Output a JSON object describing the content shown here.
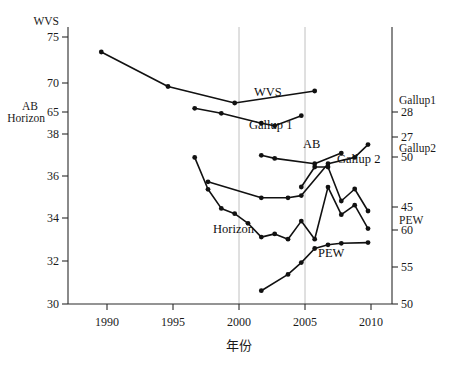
{
  "chart_data": {
    "type": "line",
    "title": "",
    "subtitle": "",
    "xlabel": "年份",
    "ylabel": "",
    "grid": "vertical gridlines at 2000 and 2005",
    "legend": "inline series labels placed next to each line",
    "xlim": [
      1987.5,
      2011.8
    ],
    "x_ticks": [
      1990,
      1995,
      2000,
      2005,
      2010
    ],
    "left_axis": {
      "name_top": "WVS",
      "name_bottom_line1": "AB",
      "name_bottom_line2": "Horizon",
      "wvs_ticks": [
        75,
        70,
        65
      ],
      "ab_horizon_ticks": [
        38,
        36,
        34,
        32,
        30
      ]
    },
    "right_axis": {
      "gallup1_name": "Gallup1",
      "gallup1_ticks": [
        28,
        27
      ],
      "gallup2_name": "Gallup2",
      "gallup2_ticks": [
        50,
        45
      ],
      "pew_name": "PEW",
      "pew_ticks": [
        60,
        55,
        50
      ]
    },
    "series": [
      {
        "name": "WVS",
        "label": "WVS",
        "axis": "WVS (left, 65-75)",
        "points": [
          {
            "x": 1990,
            "y": 73.0
          },
          {
            "x": 1995,
            "y": 68.4
          },
          {
            "x": 2000,
            "y": 66.2
          },
          {
            "x": 2006,
            "y": 67.8
          }
        ]
      },
      {
        "name": "Gallup 1",
        "label": "Gallup 1",
        "axis": "Gallup1 (right, 27-28)",
        "points": [
          {
            "x": 1997,
            "y": 28.15
          },
          {
            "x": 1999,
            "y": 27.95
          },
          {
            "x": 2002,
            "y": 27.55
          },
          {
            "x": 2003,
            "y": 27.45
          },
          {
            "x": 2005,
            "y": 27.85
          }
        ]
      },
      {
        "name": "AB",
        "label": "AB",
        "axis": "AB (left, 30-38)",
        "points": [
          {
            "x": 2002,
            "y": 37.0
          },
          {
            "x": 2003,
            "y": 36.85
          },
          {
            "x": 2006,
            "y": 36.6
          },
          {
            "x": 2008,
            "y": 37.1
          }
        ]
      },
      {
        "name": "Gallup 2",
        "label": "Gallup 2",
        "axis": "Gallup2 (right, 45-50)",
        "points": [
          {
            "x": 2005,
            "y": 47.0
          },
          {
            "x": 2006,
            "y": 49.0
          },
          {
            "x": 2007,
            "y": 49.0
          },
          {
            "x": 2008,
            "y": 45.6
          },
          {
            "x": 2009,
            "y": 46.8
          },
          {
            "x": 2010,
            "y": 44.6
          }
        ]
      },
      {
        "name": "Horizon top",
        "label": "",
        "axis": "Horizon (left, 30-38)",
        "points": [
          {
            "x": 1997,
            "y": 36.9
          },
          {
            "x": 1998,
            "y": 35.4
          },
          {
            "x": 1999,
            "y": 34.5
          },
          {
            "x": 2000,
            "y": 34.25
          },
          {
            "x": 2001,
            "y": 33.8
          },
          {
            "x": 2002,
            "y": 33.15
          },
          {
            "x": 2003,
            "y": 33.3
          },
          {
            "x": 2004,
            "y": 33.05
          },
          {
            "x": 2005,
            "y": 33.9
          },
          {
            "x": 2006,
            "y": 33.05
          },
          {
            "x": 2007,
            "y": 35.5
          },
          {
            "x": 2008,
            "y": 34.2
          },
          {
            "x": 2009,
            "y": 34.65
          },
          {
            "x": 2010,
            "y": 33.55
          }
        ]
      },
      {
        "name": "Horizon",
        "label": "Horizon",
        "axis": "Horizon (left, 30-38)",
        "points": [
          {
            "x": 1998,
            "y": 35.75
          },
          {
            "x": 2002,
            "y": 35.0
          },
          {
            "x": 2004,
            "y": 35.0
          },
          {
            "x": 2005,
            "y": 35.1
          },
          {
            "x": 2007,
            "y": 36.6
          },
          {
            "x": 2009,
            "y": 36.9
          },
          {
            "x": 2010,
            "y": 37.5
          }
        ]
      },
      {
        "name": "PEW",
        "label": "PEW",
        "axis": "PEW (right, 50-60)",
        "points": [
          {
            "x": 2002,
            "y": 51.8
          },
          {
            "x": 2004,
            "y": 54.0
          },
          {
            "x": 2005,
            "y": 55.6
          },
          {
            "x": 2006,
            "y": 57.5
          },
          {
            "x": 2007,
            "y": 58.0
          },
          {
            "x": 2008,
            "y": 58.2
          },
          {
            "x": 2010,
            "y": 58.3
          }
        ]
      }
    ]
  },
  "axes": {
    "x_tick_labels": [
      "1990",
      "1995",
      "2000",
      "2005",
      "2010"
    ],
    "x_title": "年份",
    "left_top_name": "WVS",
    "left_ticks": [
      "75",
      "70",
      "65",
      "38",
      "36",
      "34",
      "32",
      "30"
    ],
    "left_mid_name_1": "AB",
    "left_mid_name_2": "Horizon",
    "right_ticks": [
      "28",
      "27",
      "50",
      "45",
      "60",
      "55",
      "50"
    ],
    "right_name_gallup1": "Gallup1",
    "right_name_gallup2": "Gallup2",
    "right_name_pew": "PEW"
  },
  "series_labels": {
    "wvs": "WVS",
    "gallup1": "Gallup 1",
    "ab": "AB",
    "gallup2": "Gallup 2",
    "horizon": "Horizon",
    "pew": "PEW"
  },
  "colors": {
    "line": "#111111",
    "axis": "#2a2a2a",
    "grid": "#b9b9b9",
    "background": "#ffffff"
  }
}
